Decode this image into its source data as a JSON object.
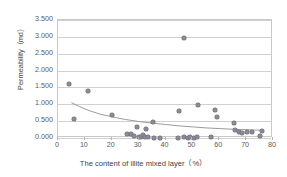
{
  "chart_data": {
    "type": "scatter",
    "title": "",
    "xlabel": "The content of illite mixed layer（%）",
    "ylabel": "Permeability（md）",
    "xlim": [
      0,
      80
    ],
    "ylim": [
      0,
      3.5
    ],
    "xticks": [
      0,
      10,
      20,
      30,
      40,
      50,
      60,
      70,
      80
    ],
    "xtick_labels": [
      "0",
      "10",
      "20",
      "30",
      "40",
      "50",
      "60",
      "70",
      "80"
    ],
    "yticks": [
      0,
      0.5,
      1.0,
      1.5,
      2.0,
      2.5,
      3.0,
      3.5
    ],
    "ytick_labels": [
      "0.000",
      "0.500",
      "1.000",
      "1.500",
      "2.000",
      "2.500",
      "3.000",
      "3.500"
    ],
    "grid": "horizontal",
    "legend": "none",
    "marker_color": "#8a8a96",
    "trendline_color": "#8f8f8f",
    "series": [
      {
        "name": "Permeability vs illite mixed layer content",
        "points": [
          [
            4.0,
            1.6
          ],
          [
            6.0,
            0.55
          ],
          [
            11.0,
            1.4
          ],
          [
            20.0,
            0.67
          ],
          [
            25.8,
            0.13
          ],
          [
            27.2,
            0.11
          ],
          [
            28.3,
            0.07
          ],
          [
            29.5,
            0.32
          ],
          [
            30.3,
            0.02
          ],
          [
            31.0,
            0.03
          ],
          [
            31.6,
            0.08
          ],
          [
            32.2,
            0.02
          ],
          [
            32.8,
            0.28
          ],
          [
            33.4,
            0.02
          ],
          [
            35.3,
            0.47
          ],
          [
            35.8,
            0.01
          ],
          [
            38.0,
            0.01
          ],
          [
            44.5,
            0.01
          ],
          [
            45.2,
            0.8
          ],
          [
            46.8,
            2.96
          ],
          [
            47.0,
            0.02
          ],
          [
            48.2,
            0.01
          ],
          [
            49.3,
            0.02
          ],
          [
            50.5,
            0.01
          ],
          [
            51.7,
            0.02
          ],
          [
            52.0,
            0.99
          ],
          [
            57.0,
            0.02
          ],
          [
            58.3,
            0.82
          ],
          [
            59.2,
            0.63
          ],
          [
            65.4,
            0.45
          ],
          [
            66.0,
            0.25
          ],
          [
            67.3,
            0.17
          ],
          [
            68.5,
            0.14
          ],
          [
            70.5,
            0.19
          ],
          [
            72.0,
            0.19
          ],
          [
            75.0,
            0.05
          ],
          [
            76.0,
            0.21
          ]
        ]
      }
    ],
    "trendline": {
      "type": "power",
      "description": "decaying power-law fit",
      "points": [
        [
          5.0,
          1.05
        ],
        [
          8.0,
          0.93
        ],
        [
          12.0,
          0.8
        ],
        [
          16.0,
          0.7
        ],
        [
          20.0,
          0.63
        ],
        [
          25.0,
          0.55
        ],
        [
          30.0,
          0.49
        ],
        [
          35.0,
          0.44
        ],
        [
          40.0,
          0.4
        ],
        [
          45.0,
          0.36
        ],
        [
          50.0,
          0.33
        ],
        [
          55.0,
          0.3
        ],
        [
          60.0,
          0.28
        ],
        [
          65.0,
          0.26
        ],
        [
          70.0,
          0.245
        ],
        [
          76.0,
          0.23
        ]
      ]
    }
  }
}
